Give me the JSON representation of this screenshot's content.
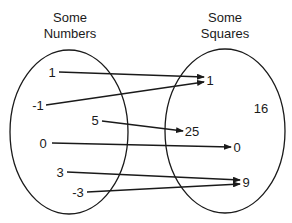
{
  "diagram": {
    "type": "function-mapping",
    "domain_set": {
      "title_line1": "Some",
      "title_line2": "Numbers",
      "elements": [
        "1",
        "-1",
        "5",
        "0",
        "3",
        "-3"
      ]
    },
    "codomain_set": {
      "title_line1": "Some",
      "title_line2": "Squares",
      "elements": [
        "1",
        "16",
        "25",
        "0",
        "9"
      ]
    },
    "mappings": [
      {
        "from": "1",
        "to": "1"
      },
      {
        "from": "-1",
        "to": "1"
      },
      {
        "from": "5",
        "to": "25"
      },
      {
        "from": "0",
        "to": "0"
      },
      {
        "from": "3",
        "to": "9"
      },
      {
        "from": "-3",
        "to": "9"
      }
    ],
    "colors": {
      "stroke": "#1a1a1a",
      "background": "#ffffff"
    }
  }
}
